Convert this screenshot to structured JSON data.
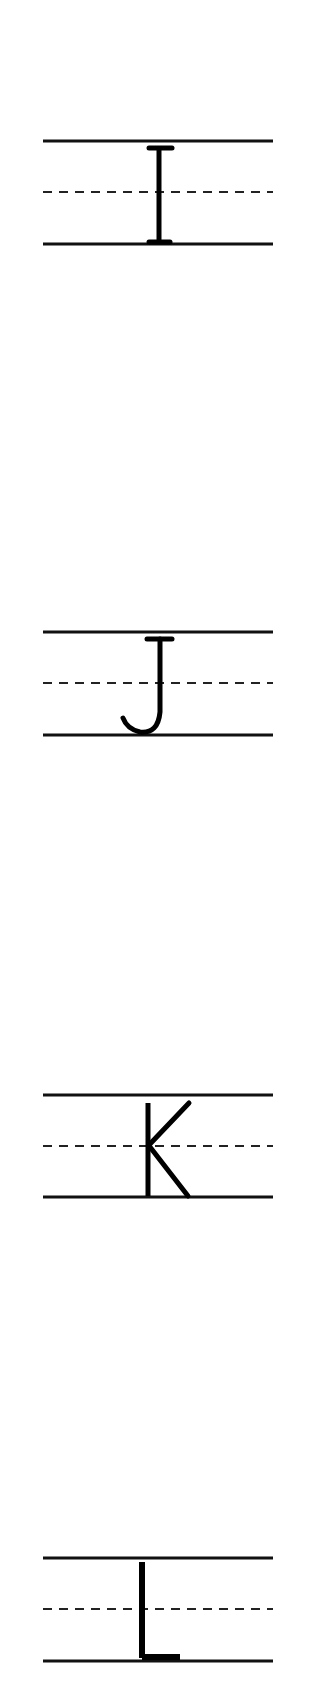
{
  "worksheet": {
    "title": "Letter tracing I J K L",
    "line_color": "#111111",
    "letters": [
      {
        "letter": "I",
        "top_y": 141
      },
      {
        "letter": "J",
        "top_y": 632
      },
      {
        "letter": "K",
        "top_y": 1095
      },
      {
        "letter": "L",
        "top_y": 1558
      }
    ]
  }
}
